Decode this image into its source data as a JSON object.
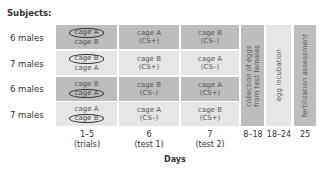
{
  "header": {
    "subjects_label": "Subjects:"
  },
  "rows": [
    {
      "label": "6 males",
      "shade": "dark",
      "trials": {
        "line1": "cage A",
        "line2": "cage B",
        "circled": 1
      },
      "test1": {
        "line1": "cage A",
        "line2": "(CS+)"
      },
      "test2": {
        "line1": "cage B",
        "line2": "(CS–)"
      }
    },
    {
      "label": "7 males",
      "shade": "light",
      "trials": {
        "line1": "cage B",
        "line2": "cage A",
        "circled": 1
      },
      "test1": {
        "line1": "cage B",
        "line2": "(CS+)"
      },
      "test2": {
        "line1": "cage A",
        "line2": "(CS–)"
      }
    },
    {
      "label": "6 males",
      "shade": "dark",
      "trials": {
        "line1": "cage B",
        "line2": "cage A",
        "circled": 2
      },
      "test1": {
        "line1": "cage B",
        "line2": "(CS–)"
      },
      "test2": {
        "line1": "cage A",
        "line2": "(CS+)"
      }
    },
    {
      "label": "7 males",
      "shade": "light",
      "trials": {
        "line1": "cage A",
        "line2": "cage B",
        "circled": 2
      },
      "test1": {
        "line1": "cage A",
        "line2": "(CS–)"
      },
      "test2": {
        "line1": "cage B",
        "line2": "(CS+)"
      }
    }
  ],
  "phases": [
    {
      "text_line1": "collection of eggs",
      "text_line2": "from test females",
      "shade": "dark",
      "days": "8–18"
    },
    {
      "text_line1": "egg incubation",
      "text_line2": "",
      "shade": "light",
      "days": "18–24"
    },
    {
      "text_line1": "fertilization assessment",
      "text_line2": "",
      "shade": "dark",
      "days": "25"
    }
  ],
  "day_columns": [
    {
      "line1": "1–5",
      "line2": "(trials)"
    },
    {
      "line1": "6",
      "line2": "(test 1)"
    },
    {
      "line1": "7",
      "line2": "(test 2)"
    }
  ],
  "axis": {
    "xlabel": "Days"
  },
  "colors": {
    "dark_cell": "#bdbdbd",
    "light_cell": "#e6e6e6",
    "text": "#555555"
  }
}
